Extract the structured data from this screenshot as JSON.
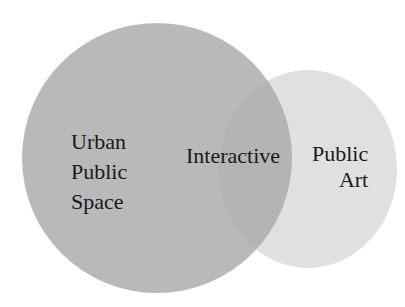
{
  "diagram": {
    "type": "venn",
    "sets": [
      {
        "id": "urban-public-space",
        "lines": [
          "Urban",
          "Public",
          "Space"
        ],
        "color": "#b8b8b8"
      },
      {
        "id": "public-art",
        "lines": [
          "Public",
          "Art"
        ],
        "color": "#e0e0e0"
      }
    ],
    "intersection": {
      "label": "Interactive",
      "color": "#b0b0b0"
    }
  }
}
